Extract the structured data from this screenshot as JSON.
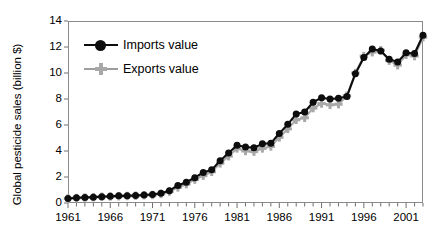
{
  "chart_data": {
    "type": "line",
    "title": "",
    "xlabel": "",
    "ylabel": "Global pesticide sales (billion $)",
    "xlim": [
      1961,
      2003
    ],
    "ylim": [
      0,
      14
    ],
    "ytick_values": [
      0,
      2,
      4,
      6,
      8,
      10,
      12,
      14
    ],
    "ytick_labels": [
      "0",
      "2",
      "4",
      "6",
      "8",
      "10",
      "12",
      "14"
    ],
    "xtick_labels": [
      "1961",
      "1966",
      "1971",
      "1976",
      "1981",
      "1986",
      "1991",
      "1996",
      "2001"
    ],
    "xtick_values": [
      1961,
      1966,
      1971,
      1976,
      1981,
      1986,
      1991,
      1996,
      2001
    ],
    "minor_xticks_every": 1,
    "grid": false,
    "legend_position": "upper-left-inside",
    "x": [
      1961,
      1962,
      1963,
      1964,
      1965,
      1966,
      1967,
      1968,
      1969,
      1970,
      1971,
      1972,
      1973,
      1974,
      1975,
      1976,
      1977,
      1978,
      1979,
      1980,
      1981,
      1982,
      1983,
      1984,
      1985,
      1986,
      1987,
      1988,
      1989,
      1990,
      1991,
      1992,
      1993,
      1994,
      1995,
      1996,
      1997,
      1998,
      1999,
      2000,
      2001,
      2002,
      2003
    ],
    "series": [
      {
        "name": "Imports value",
        "color": "#0d0d0d",
        "marker": "circle",
        "values": [
          0.35,
          0.4,
          0.42,
          0.45,
          0.48,
          0.52,
          0.55,
          0.55,
          0.58,
          0.62,
          0.65,
          0.75,
          0.95,
          1.35,
          1.6,
          1.95,
          2.35,
          2.55,
          3.25,
          3.85,
          4.45,
          4.3,
          4.25,
          4.55,
          4.6,
          5.35,
          6.05,
          6.85,
          7.0,
          7.75,
          8.1,
          8.0,
          8.05,
          8.2,
          9.95,
          11.2,
          11.85,
          11.7,
          11.05,
          10.85,
          11.55,
          11.5,
          12.9
        ]
      },
      {
        "name": "Exports value",
        "color": "#a8a8a8",
        "marker": "cross",
        "values": [
          0.35,
          0.38,
          0.42,
          0.45,
          0.48,
          0.5,
          0.52,
          0.54,
          0.56,
          0.6,
          0.62,
          0.7,
          0.88,
          1.2,
          1.45,
          1.8,
          2.1,
          2.4,
          3.05,
          3.6,
          4.2,
          4.0,
          3.95,
          4.2,
          4.35,
          5.05,
          5.7,
          6.4,
          6.55,
          7.3,
          7.65,
          7.55,
          7.6,
          8.25,
          10.0,
          11.3,
          11.6,
          11.75,
          10.95,
          10.6,
          11.4,
          11.3,
          12.75
        ]
      }
    ]
  }
}
